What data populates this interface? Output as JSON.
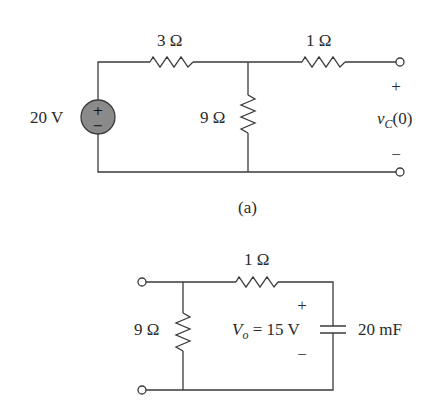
{
  "figure_a": {
    "caption": "(a)",
    "source": {
      "label": "20 V",
      "plus": "+",
      "minus": "−",
      "fill_color": "#8a8a8a"
    },
    "resistor_series_left": {
      "label": "3 Ω"
    },
    "resistor_shunt": {
      "label": "9 Ω"
    },
    "resistor_series_right": {
      "label": "1 Ω"
    },
    "output": {
      "plus": "+",
      "minus": "−",
      "var": "v",
      "sub": "C",
      "arg": "(0)"
    }
  },
  "figure_b": {
    "resistor_shunt": {
      "label": "9 Ω"
    },
    "resistor_series": {
      "label": "1 Ω"
    },
    "capacitor": {
      "label": "20 mF"
    },
    "voltage": {
      "plus": "+",
      "minus": "−",
      "var": "V",
      "sub": "o",
      "eq": " = 15 V"
    }
  }
}
